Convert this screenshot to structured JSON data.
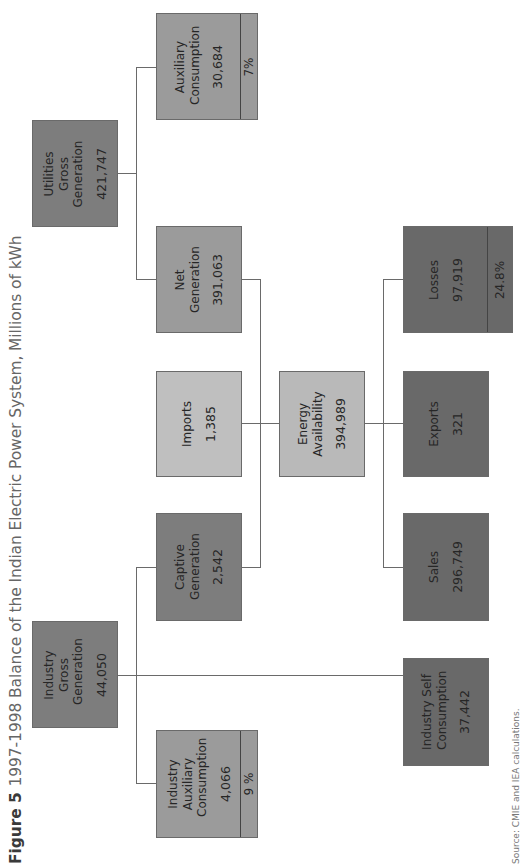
{
  "title": {
    "figure_label": "Figure 5",
    "text": "1997-1998 Balance of the Indian Electric Power System, Millions of kWh"
  },
  "source": "Source: CMIE and IEA calculations.",
  "nodes": {
    "utilities_gross_generation": {
      "label": "Utilities Gross Generation",
      "value": "421,747"
    },
    "auxiliary_consumption": {
      "label": "Auxiliary Consumption",
      "value": "30,684",
      "pct": "7%"
    },
    "net_generation": {
      "label": "Net Generation",
      "value": "391,063"
    },
    "imports": {
      "label": "Imports",
      "value": "1,385"
    },
    "captive_generation": {
      "label": "Captive Generation",
      "value": "2,542"
    },
    "industry_gross_generation": {
      "label": "Industry Gross Generation",
      "value": "44,050"
    },
    "industry_auxiliary_consumption": {
      "label": "Industry Auxiliary Consumption",
      "value": "4,066",
      "pct": "9 %"
    },
    "energy_availability": {
      "label": "Energy Availability",
      "value": "394,989"
    },
    "losses": {
      "label": "Losses",
      "value": "97,919",
      "pct": "24.8%"
    },
    "exports": {
      "label": "Exports",
      "value": "321"
    },
    "sales": {
      "label": "Sales",
      "value": "296,749"
    },
    "industry_self_consumption": {
      "label": "Industry Self Consumption",
      "value": "37,442"
    }
  },
  "colors": {
    "dark": "#7d7d7d",
    "mid": "#9b9b9b",
    "light": "#bfbfbf",
    "darkest": "#696969",
    "connector": "#6a6a6a"
  }
}
